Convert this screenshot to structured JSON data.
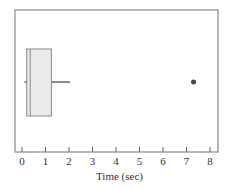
{
  "chart_data": {
    "type": "box",
    "title": "",
    "xlabel": "Time (sec)",
    "ylabel": "",
    "xlim": [
      -0.3,
      8.3
    ],
    "x_ticks": [
      0,
      1,
      2,
      3,
      4,
      5,
      6,
      7,
      8
    ],
    "x_tick_labels": [
      "0",
      "1",
      "2",
      "3",
      "4",
      "5",
      "6",
      "7",
      "8"
    ],
    "grid": false,
    "orientation": "horizontal",
    "series": [
      {
        "name": "Time",
        "whisker_low": 0.1,
        "q1": 0.2,
        "median": 0.35,
        "q3": 1.25,
        "whisker_high": 2.05,
        "outliers": [
          7.3
        ]
      }
    ],
    "colors": {
      "box_fill": "#ebebeb",
      "box_stroke": "#888888",
      "whisker": "#666666",
      "outlier": "#444444",
      "frame": "#888888"
    }
  },
  "axis": {
    "xlabel": "Time (sec)"
  }
}
